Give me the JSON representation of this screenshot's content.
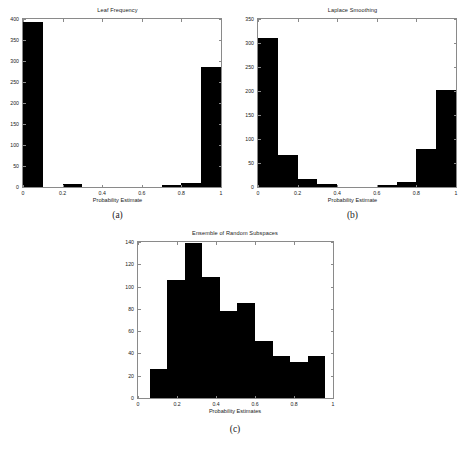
{
  "figure": {
    "panels": [
      {
        "id": "a",
        "subfig_label": "(a)",
        "title": "Leaf Frequency",
        "xlabel": "Probability Estimate",
        "ylabel": ""
      },
      {
        "id": "b",
        "subfig_label": "(b)",
        "title": "Laplace Smoothing",
        "xlabel": "Probability Estimate",
        "ylabel": ""
      },
      {
        "id": "c",
        "subfig_label": "(c)",
        "title": "Ensemble of Random Subspaces",
        "xlabel": "Probability Estimates",
        "ylabel": ""
      }
    ]
  },
  "chart_data": [
    {
      "type": "bar",
      "title": "Leaf Frequency",
      "xlabel": "Probability Estimate",
      "ylabel": "",
      "xlim": [
        0,
        1
      ],
      "ylim": [
        0,
        400
      ],
      "xticks": [
        0,
        0.2,
        0.4,
        0.6,
        0.8,
        1
      ],
      "xticklabels": [
        "0",
        "0.2",
        "0.4",
        "0.6",
        "0.8",
        "1"
      ],
      "yticks": [
        0,
        50,
        100,
        150,
        200,
        250,
        300,
        350,
        400
      ],
      "yticklabels": [
        "0",
        "50",
        "100",
        "150",
        "200",
        "250",
        "300",
        "350",
        "400"
      ],
      "grid": false,
      "legend": null,
      "bin_edges": [
        0,
        0.1,
        0.2,
        0.3,
        0.4,
        0.5,
        0.6,
        0.7,
        0.8,
        0.9,
        1.0
      ],
      "categories": [
        "0-0.1",
        "0.1-0.2",
        "0.2-0.3",
        "0.3-0.4",
        "0.4-0.5",
        "0.5-0.6",
        "0.6-0.7",
        "0.7-0.8",
        "0.8-0.9",
        "0.9-1.0"
      ],
      "values": [
        393,
        0,
        8,
        0,
        0,
        0,
        0,
        5,
        10,
        285
      ]
    },
    {
      "type": "bar",
      "title": "Laplace Smoothing",
      "xlabel": "Probability Estimate",
      "ylabel": "",
      "xlim": [
        0,
        1
      ],
      "ylim": [
        0,
        350
      ],
      "xticks": [
        0,
        0.2,
        0.4,
        0.6,
        0.8,
        1
      ],
      "xticklabels": [
        "0",
        "0.2",
        "0.4",
        "0.6",
        "0.8",
        "1"
      ],
      "yticks": [
        0,
        50,
        100,
        150,
        200,
        250,
        300,
        350
      ],
      "yticklabels": [
        "0",
        "50",
        "100",
        "150",
        "200",
        "250",
        "300",
        "350"
      ],
      "grid": false,
      "legend": null,
      "bin_edges": [
        0,
        0.1,
        0.2,
        0.3,
        0.4,
        0.5,
        0.6,
        0.7,
        0.8,
        0.9,
        1.0
      ],
      "categories": [
        "0-0.1",
        "0.1-0.2",
        "0.2-0.3",
        "0.3-0.4",
        "0.4-0.5",
        "0.5-0.6",
        "0.6-0.7",
        "0.7-0.8",
        "0.8-0.9",
        "0.9-1.0"
      ],
      "values": [
        311,
        66,
        17,
        7,
        0,
        0,
        5,
        11,
        80,
        202
      ]
    },
    {
      "type": "bar",
      "title": "Ensemble of Random Subspaces",
      "xlabel": "Probability Estimates",
      "ylabel": "",
      "xlim": [
        0,
        1
      ],
      "ylim": [
        0,
        140
      ],
      "xticks": [
        0,
        0.2,
        0.4,
        0.6,
        0.8,
        1
      ],
      "xticklabels": [
        "0",
        "0.2",
        "0.4",
        "0.6",
        "0.8",
        "1"
      ],
      "yticks": [
        0,
        20,
        40,
        60,
        80,
        100,
        120,
        140
      ],
      "yticklabels": [
        "0",
        "20",
        "40",
        "60",
        "80",
        "100",
        "120",
        "140"
      ],
      "grid": false,
      "legend": null,
      "bin_edges": [
        0.06,
        0.15,
        0.24,
        0.33,
        0.42,
        0.51,
        0.6,
        0.69,
        0.78,
        0.87,
        0.96
      ],
      "categories": [
        "0.06-0.15",
        "0.15-0.24",
        "0.24-0.33",
        "0.33-0.42",
        "0.42-0.51",
        "0.51-0.60",
        "0.60-0.69",
        "0.69-0.78",
        "0.78-0.87",
        "0.87-0.96"
      ],
      "values": [
        26,
        106,
        139,
        109,
        78,
        85,
        51,
        38,
        32,
        38
      ]
    }
  ]
}
